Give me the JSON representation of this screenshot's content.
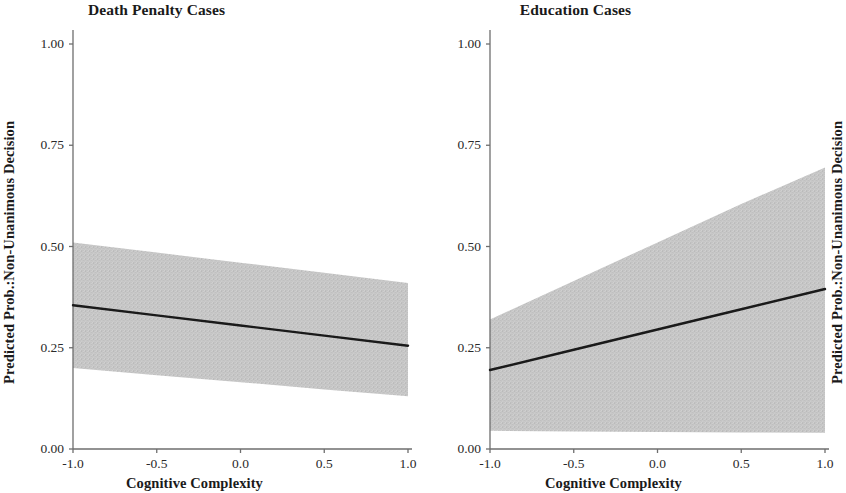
{
  "figure": {
    "axis_y_label": "Predicted Prob.:Non-Unanimous Decision",
    "axis_x_label": "Cognitive Complexity",
    "line_color": "#1a1a1a",
    "band_color": "#c9c9c9",
    "axis_color": "#6e6e6e"
  },
  "chart_data": [
    {
      "type": "line",
      "title": "Death Penalty Cases",
      "xlabel": "Cognitive Complexity",
      "ylabel": "Predicted Prob.:Non-Unanimous Decision",
      "xlim": [
        -1.0,
        1.0
      ],
      "ylim": [
        0.0,
        1.0
      ],
      "xticks": [
        -1.0,
        -0.5,
        0.0,
        0.5,
        1.0
      ],
      "xtick_labels": [
        "-1.0",
        "-0.5",
        "0.0",
        "0.5",
        "1.0"
      ],
      "yticks": [
        0.0,
        0.25,
        0.5,
        0.75,
        1.0
      ],
      "ytick_labels": [
        "0.00",
        "0.25",
        "0.50",
        "0.75",
        "1.00"
      ],
      "grid": false,
      "legend": "none",
      "x": [
        -1.0,
        -0.5,
        0.0,
        0.5,
        1.0
      ],
      "series": [
        {
          "name": "Predicted probability",
          "values": [
            0.355,
            0.33,
            0.305,
            0.28,
            0.255
          ]
        },
        {
          "name": "95% CI upper",
          "values": [
            0.51,
            0.485,
            0.46,
            0.435,
            0.41
          ]
        },
        {
          "name": "95% CI lower",
          "values": [
            0.2,
            0.182,
            0.165,
            0.147,
            0.13
          ]
        }
      ]
    },
    {
      "type": "line",
      "title": "Education Cases",
      "xlabel": "Cognitive Complexity",
      "ylabel": "Predicted Prob.:Non-Unanimous Decision",
      "xlim": [
        -1.0,
        1.0
      ],
      "ylim": [
        0.0,
        1.0
      ],
      "xticks": [
        -1.0,
        -0.5,
        0.0,
        0.5,
        1.0
      ],
      "xtick_labels": [
        "-1.0",
        "-0.5",
        "0.0",
        "0.5",
        "1.0"
      ],
      "yticks": [
        0.0,
        0.25,
        0.5,
        0.75,
        1.0
      ],
      "ytick_labels": [
        "0.00",
        "0.25",
        "0.50",
        "0.75",
        "1.00"
      ],
      "grid": false,
      "legend": "none",
      "x": [
        -1.0,
        -0.5,
        0.0,
        0.5,
        1.0
      ],
      "series": [
        {
          "name": "Predicted probability",
          "values": [
            0.195,
            0.245,
            0.295,
            0.345,
            0.395
          ]
        },
        {
          "name": "95% CI upper",
          "values": [
            0.32,
            0.415,
            0.51,
            0.605,
            0.695
          ]
        },
        {
          "name": "95% CI lower",
          "values": [
            0.045,
            0.043,
            0.042,
            0.041,
            0.04
          ]
        }
      ]
    }
  ]
}
